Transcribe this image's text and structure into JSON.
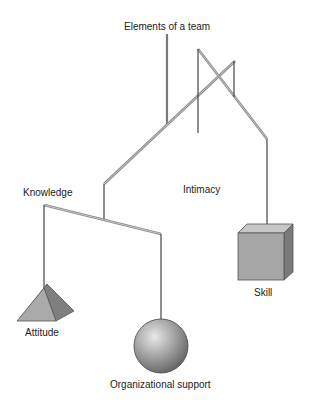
{
  "diagram": {
    "title": "Elements of a team",
    "type": "mobile",
    "labels": {
      "title": "Elements of a team",
      "knowledge": "Knowledge",
      "intimacy": "Intimacy",
      "skill": "Skill",
      "attitude": "Attitude",
      "organizational_support": "Organizational support"
    },
    "elements": [
      {
        "name": "Elements of a team",
        "shape": "top suspension string"
      },
      {
        "name": "Knowledge",
        "shape": "rod"
      },
      {
        "name": "Intimacy",
        "shape": "rod"
      },
      {
        "name": "Skill",
        "shape": "cube"
      },
      {
        "name": "Attitude",
        "shape": "triangular prism"
      },
      {
        "name": "Organizational support",
        "shape": "sphere"
      }
    ],
    "colors": {
      "rod": "#8a8a8a",
      "string": "#444444",
      "shape_fill": "#a8a8a8",
      "shape_dark": "#7d7d7d",
      "shape_light": "#c8c8c8"
    }
  }
}
